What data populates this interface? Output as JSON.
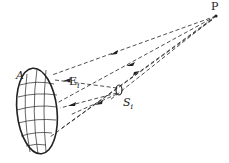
{
  "labels": {
    "point": "P",
    "surface": "A",
    "field": "E",
    "field_sub": "i",
    "source": "S",
    "source_sub": "i"
  },
  "colors": {
    "ink": "#222222",
    "background": "#ffffff"
  }
}
